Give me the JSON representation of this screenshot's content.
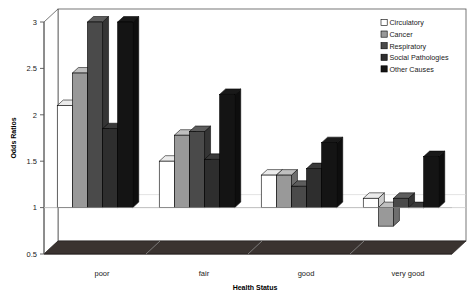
{
  "chart_data": {
    "type": "bar",
    "title": "",
    "xlabel": "Health Status",
    "ylabel": "Odds Ratios",
    "categories": [
      "poor",
      "fair",
      "good",
      "very good"
    ],
    "ylim": [
      0.5,
      3.0
    ],
    "yticks": [
      0.5,
      1,
      1.5,
      2,
      2.5,
      3
    ],
    "ytick_labels": [
      "0.5",
      "1",
      "1.5",
      "2",
      "2.5",
      "3"
    ],
    "baseline": 1.0,
    "grid": false,
    "legend_position": "top-right",
    "style": "3d-column",
    "series": [
      {
        "name": "Circulatory",
        "color": "#ffffff",
        "values": [
          2.1,
          1.5,
          1.35,
          1.1
        ]
      },
      {
        "name": "Cancer",
        "color": "#999999",
        "values": [
          2.45,
          1.78,
          1.35,
          0.8
        ]
      },
      {
        "name": "Respiratory",
        "color": "#4a4a4a",
        "values": [
          3.0,
          1.82,
          1.23,
          1.1
        ]
      },
      {
        "name": "Social Pathologies",
        "color": "#2e2e2e",
        "values": [
          1.85,
          1.52,
          1.42,
          1.0
        ]
      },
      {
        "name": "Other Causes",
        "color": "#141414",
        "values": [
          3.0,
          2.22,
          1.7,
          1.55
        ]
      }
    ]
  },
  "axes": {
    "y_title": "Odds Ratios",
    "x_title": "Health Status"
  }
}
